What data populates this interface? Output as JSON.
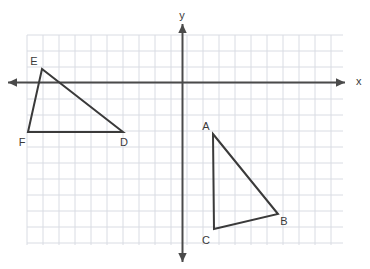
{
  "figure": {
    "background_color": "#ffffff",
    "grid": {
      "color": "#d9dce3",
      "cell_size_px": 16,
      "left_px": 27,
      "top_px": 35,
      "right_px": 343,
      "bottom_px": 245,
      "columns": 19,
      "rows": 13
    },
    "axes": {
      "color": "#4a4a4a",
      "origin_px": {
        "x": 182.5,
        "y": 82.5
      },
      "x_axis": {
        "label": "x",
        "label_px": {
          "x": 356,
          "y": 82
        },
        "start_px": {
          "x": 8,
          "y": 82.5
        },
        "end_px": {
          "x": 345,
          "y": 82.5
        },
        "arrows": "both"
      },
      "y_axis": {
        "label": "y",
        "label_px": {
          "x": 182,
          "y": 16
        },
        "start_px": {
          "x": 182.5,
          "y": 24
        },
        "end_px": {
          "x": 182.5,
          "y": 262
        },
        "arrows": "both"
      }
    },
    "shapes": [
      {
        "name": "triangle-abc",
        "stroke_color": "#3a3a3a",
        "stroke_width": 2,
        "fill": "none",
        "vertices": [
          {
            "label": "A",
            "px": {
              "x": 213,
              "y": 134
            },
            "grid": {
              "x": 2,
              "y": -3
            },
            "label_px": {
              "x": 206,
              "y": 127
            }
          },
          {
            "label": "B",
            "px": {
              "x": 278,
              "y": 214
            },
            "grid": {
              "x": 6,
              "y": -8
            },
            "label_px": {
              "x": 284,
              "y": 222
            }
          },
          {
            "label": "C",
            "px": {
              "x": 214,
              "y": 229
            },
            "grid": {
              "x": 2,
              "y": -9
            },
            "label_px": {
              "x": 206,
              "y": 241
            }
          }
        ]
      },
      {
        "name": "triangle-def",
        "stroke_color": "#3a3a3a",
        "stroke_width": 2,
        "fill": "none",
        "vertices": [
          {
            "label": "D",
            "px": {
              "x": 123,
              "y": 132
            },
            "grid": {
              "x": -4,
              "y": -3
            },
            "label_px": {
              "x": 124,
              "y": 143
            }
          },
          {
            "label": "E",
            "px": {
              "x": 42,
              "y": 69
            },
            "grid": {
              "x": -9,
              "y": 1
            },
            "label_px": {
              "x": 34,
              "y": 62
            }
          },
          {
            "label": "F",
            "px": {
              "x": 28,
              "y": 132
            },
            "grid": {
              "x": -10,
              "y": -3
            },
            "label_px": {
              "x": 22,
              "y": 143
            }
          }
        ]
      }
    ]
  },
  "chart_data": {
    "type": "scatter",
    "xlabel": "x",
    "ylabel": "y",
    "xlim": [
      -10,
      10
    ],
    "ylim": [
      -10,
      4
    ],
    "grid": true,
    "legend": "none",
    "series": [
      {
        "name": "Triangle ABC",
        "points": [
          {
            "label": "A",
            "x": 2,
            "y": -3
          },
          {
            "label": "B",
            "x": 6,
            "y": -8
          },
          {
            "label": "C",
            "x": 2,
            "y": -9
          }
        ],
        "closed": true
      },
      {
        "name": "Triangle DEF",
        "points": [
          {
            "label": "D",
            "x": -4,
            "y": -3
          },
          {
            "label": "E",
            "x": -9,
            "y": 1
          },
          {
            "label": "F",
            "x": -10,
            "y": -3
          }
        ],
        "closed": true
      }
    ],
    "annotations": [
      "A",
      "B",
      "C",
      "D",
      "E",
      "F",
      "x",
      "y"
    ]
  }
}
